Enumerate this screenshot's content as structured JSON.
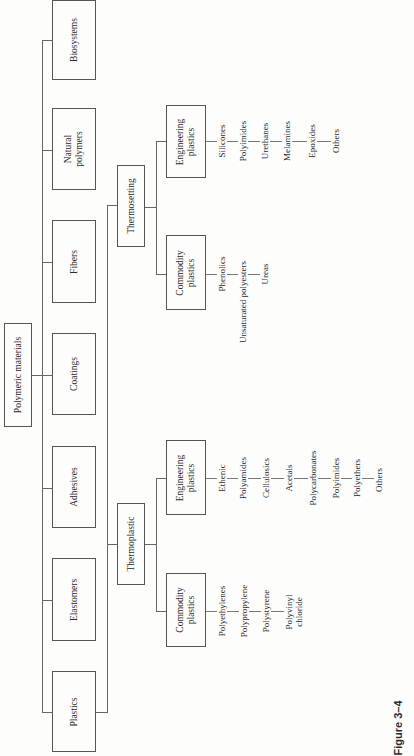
{
  "root": {
    "label": "Polymeric materials"
  },
  "categories": [
    {
      "label": "Biosystems"
    },
    {
      "label": "Natural\npolymers"
    },
    {
      "label": "Fibers"
    },
    {
      "label": "Coatings"
    },
    {
      "label": "Adhesives"
    },
    {
      "label": "Elastomers"
    },
    {
      "label": "Plastics"
    }
  ],
  "plastics": {
    "thermosetting": {
      "label": "Thermosetting",
      "engineering": {
        "label": "Engineering\nplastics",
        "items": [
          "Silicones",
          "Polyimides",
          "Urethanes",
          "Melamines",
          "Epoxides",
          "Others"
        ]
      },
      "commodity": {
        "label": "Commodity\nplastics",
        "items": [
          "Phenolics",
          "Unsaturated polyesters",
          "Ureas"
        ]
      }
    },
    "thermoplastic": {
      "label": "Thermoplastic",
      "engineering": {
        "label": "Engineering\nplastics",
        "items": [
          "Ethenic",
          "Polyamides",
          "Cellulosics",
          "Acetals",
          "Polycarbonates",
          "Polyimides",
          "Polyethers",
          "Others"
        ]
      },
      "commodity": {
        "label": "Commodity\nplastics",
        "items": [
          "Polyethylenes",
          "Polypropylene",
          "Polystyrene",
          "Polyvinyl\nchloride"
        ]
      }
    }
  },
  "caption": "Figure 3–4"
}
